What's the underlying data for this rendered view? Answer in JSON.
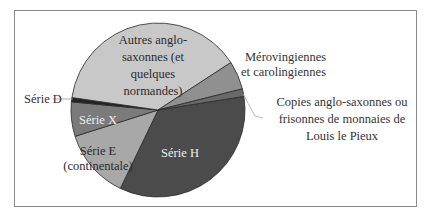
{
  "chart_data": {
    "type": "pie",
    "title": "",
    "start_angle_deg": -9,
    "direction": "clockwise",
    "slices": [
      {
        "name": "Série H",
        "label_lines": [
          "Série H"
        ],
        "value": 34.7,
        "color": "#4b4b4b"
      },
      {
        "name": "Série E (continentale)",
        "label_lines": [
          "Série E",
          "(continentale)"
        ],
        "value": 13.0,
        "color": "#a8a8a8"
      },
      {
        "name": "Série X",
        "label_lines": [
          "Série X"
        ],
        "value": 6.4,
        "color": "#7b7b7b"
      },
      {
        "name": "Série D",
        "label_lines": [
          "Série D"
        ],
        "value": 0.8,
        "color": "#242424"
      },
      {
        "name": "Autres anglo-saxonnes (et quelques normandes)",
        "label_lines": [
          "Autres anglo-",
          "saxonnes (et",
          "quelques",
          "normandes)"
        ],
        "value": 38.6,
        "color": "#c8c8c8"
      },
      {
        "name": "Mérovingiennes et carolingiennes",
        "label_lines": [
          "Mérovingiennes",
          "et carolingiennes"
        ],
        "value": 5.3,
        "color": "#909090"
      },
      {
        "name": "Copies anglo-saxonnes ou frisonnes de monnaies de Louis le Pieux",
        "label_lines": [
          "Copies anglo-saxonnes ou",
          "frisonnes de monnaies de",
          "Louis le Pieux"
        ],
        "value": 1.4,
        "color": "#6a6a6a"
      }
    ],
    "legend": "none (labels on/near slices)",
    "units": "percent (estimated)"
  },
  "labels": {
    "serie_h": "Série H",
    "serie_e_1": "Série E",
    "serie_e_2": "(continentale)",
    "serie_x": "Série X",
    "serie_d": "Série D",
    "autres_1": "Autres anglo-",
    "autres_2": "saxonnes (et",
    "autres_3": "quelques",
    "autres_4": "normandes)",
    "merov_1": "Mérovingiennes",
    "merov_2": "et carolingiennes",
    "copies_1": "Copies anglo-saxonnes ou",
    "copies_2": "frisonnes de monnaies de",
    "copies_3": "Louis le Pieux"
  }
}
